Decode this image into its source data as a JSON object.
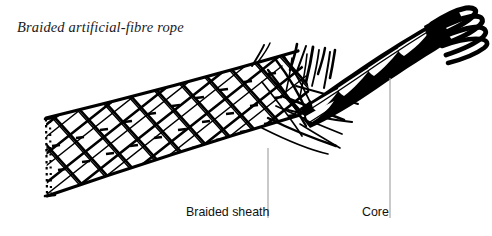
{
  "figure": {
    "title": "Braided artificial-fibre rope",
    "width": 492,
    "height": 236,
    "background_color": "#ffffff",
    "ink_color": "#000000",
    "leader_line_color": "#a6a6a6"
  },
  "callouts": [
    {
      "id": "braided-sheath",
      "label": "Braided sheath",
      "label_x": 186,
      "label_y": 205,
      "leader_x": 268,
      "leader_y_top": 148,
      "leader_y_bottom": 218
    },
    {
      "id": "core",
      "label": "Core",
      "label_x": 362,
      "label_y": 205,
      "leader_x": 390,
      "leader_y_top": 78,
      "leader_y_bottom": 218
    }
  ],
  "diagram": {
    "parts": [
      {
        "name": "braided sheath",
        "description": "tapered tubular braid of crossing fibre bands forming a diamond lattice, drawn from lower-left to upper-right",
        "pattern": "double-helix diamond braid with small dark dashes inside each diamond"
      },
      {
        "name": "cut end",
        "description": "dotted vertical cut edge at the left end of the sheath"
      },
      {
        "name": "frayed sheath fibres",
        "description": "loose sheath strands flaring upward and to the right where the braid is opened"
      },
      {
        "name": "core",
        "description": "solid dark twisted core emerging from the opened sheath"
      },
      {
        "name": "unlaid core strands",
        "description": "four splayed strand ends fanning out at the upper right tip of the core"
      }
    ]
  }
}
